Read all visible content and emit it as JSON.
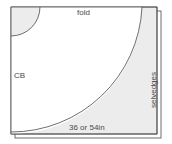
{
  "diagram": {
    "labels": {
      "fold": "fold",
      "center_back": "CB",
      "selvedges": "selvedges",
      "fabric_width": "36 or 54in"
    },
    "colors": {
      "line": "#4a4a4a",
      "fill_waste": "#ececec",
      "fill_paper": "#ffffff",
      "background": "#ffffff"
    },
    "shapes": {
      "fabric_sheet": {
        "x": 11,
        "y": 7,
        "width": 146,
        "height": 127
      },
      "underlying_sheet": {
        "x": 15,
        "y": 11,
        "width": 146,
        "height": 127
      },
      "waist_arc": {
        "cx": 11,
        "cy": 7,
        "radius": 29
      },
      "hem_arc": {
        "cx": 11,
        "cy": 7,
        "radius": 131
      }
    }
  }
}
